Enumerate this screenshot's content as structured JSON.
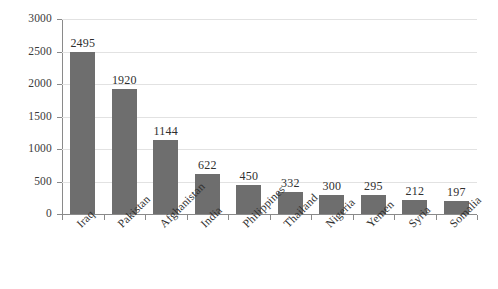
{
  "chart_data": {
    "type": "bar",
    "title": "",
    "subtitle": "",
    "xlabel": "",
    "ylabel": "",
    "categories": [
      "Iraq",
      "Pakistan",
      "Afghanistan",
      "India",
      "Philippines",
      "Thailand",
      "Nigeria",
      "Yemen",
      "Syria",
      "Somalia"
    ],
    "values": [
      2495,
      1920,
      1144,
      622,
      450,
      332,
      300,
      295,
      212,
      197
    ],
    "value_labels": [
      "2495",
      "1920",
      "1144",
      "622",
      "450",
      "332",
      "300",
      "295",
      "212",
      "197"
    ],
    "ylim": [
      0,
      3000
    ],
    "yticks": [
      0,
      500,
      1000,
      1500,
      2000,
      2500,
      3000
    ],
    "ytick_labels": [
      "0",
      "500",
      "1000",
      "1500",
      "2000",
      "2500",
      "3000"
    ],
    "grid": true,
    "legend": false,
    "legend_position": "none",
    "bar_color": "#6e6e6e",
    "gridline_color": "#e2e2e2",
    "axis_color": "#8a8a8a",
    "text_color": "#2f2f2f",
    "background_color": "#ffffff",
    "x_label_rotation": -45
  }
}
